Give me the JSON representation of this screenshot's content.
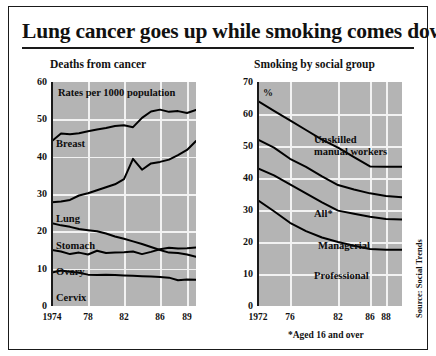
{
  "headline": "Lung cancer goes up while smoking comes down",
  "footnote": "*Aged 16 and over",
  "source": "Source: Social Trends",
  "colors": {
    "plot_background": "#b4b4b4",
    "gridline": "#f2f2f2",
    "line": "#000000",
    "text": "#111111",
    "frame": "#1a1a1a",
    "page_background": "#ffffff"
  },
  "chart_data": [
    {
      "type": "line",
      "title": "Deaths from cancer",
      "annotation": "Rates per 1000 population",
      "xlabel": "",
      "ylabel": "",
      "xlim": [
        1974,
        1990
      ],
      "ylim": [
        0,
        60
      ],
      "grid": true,
      "legend": "inline-labels",
      "x_tick_labels": [
        "1974",
        "78",
        "82",
        "86",
        "89"
      ],
      "x_tick_values": [
        1974,
        1978,
        1982,
        1986,
        1989
      ],
      "y_tick_labels": [
        "0",
        "10",
        "20",
        "30",
        "40",
        "50",
        "60"
      ],
      "y_tick_values": [
        0,
        10,
        20,
        30,
        40,
        50,
        60
      ],
      "x": [
        1974,
        1975,
        1976,
        1977,
        1978,
        1979,
        1980,
        1981,
        1982,
        1983,
        1984,
        1985,
        1986,
        1987,
        1988,
        1989,
        1990
      ],
      "series": [
        {
          "name": "Breast",
          "values": [
            44.2,
            46.2,
            46.0,
            46.3,
            46.8,
            47.3,
            47.7,
            48.2,
            48.4,
            47.9,
            50.4,
            52.1,
            52.6,
            52.0,
            52.2,
            51.7,
            52.5
          ]
        },
        {
          "name": "Lung",
          "values": [
            27.8,
            28.0,
            28.4,
            29.6,
            30.2,
            31.0,
            31.8,
            32.6,
            34.0,
            39.4,
            36.5,
            38.2,
            38.6,
            39.2,
            40.4,
            41.8,
            44.2
          ]
        },
        {
          "name": "Stomach",
          "values": [
            22.2,
            21.6,
            21.2,
            20.6,
            20.3,
            20.0,
            19.4,
            18.6,
            18.0,
            17.3,
            16.6,
            15.8,
            15.0,
            14.3,
            14.2,
            13.8,
            13.2
          ]
        },
        {
          "name": "Ovary",
          "values": [
            15.0,
            14.6,
            13.9,
            14.3,
            13.8,
            14.8,
            14.2,
            14.3,
            14.4,
            14.6,
            13.9,
            14.5,
            15.2,
            15.6,
            15.4,
            15.5,
            15.7
          ]
        },
        {
          "name": "Cervix",
          "values": [
            9.0,
            9.5,
            9.2,
            8.9,
            8.4,
            8.3,
            8.4,
            8.3,
            8.2,
            8.1,
            8.0,
            7.9,
            7.8,
            7.6,
            6.9,
            7.1,
            7.0
          ]
        }
      ]
    },
    {
      "type": "line",
      "title": "Smoking by social group",
      "annotation": "%",
      "xlabel": "",
      "ylabel": "",
      "xlim": [
        1972,
        1990
      ],
      "ylim": [
        0,
        70
      ],
      "grid": true,
      "legend": "inline-labels",
      "x_tick_labels": [
        "1972",
        "76",
        "82",
        "86",
        "88"
      ],
      "x_tick_values": [
        1972,
        1976,
        1982,
        1986,
        1988
      ],
      "y_tick_labels": [
        "0",
        "10",
        "20",
        "30",
        "40",
        "50",
        "60",
        "70"
      ],
      "y_tick_values": [
        0,
        10,
        20,
        30,
        40,
        50,
        60,
        70
      ],
      "x": [
        1972,
        1974,
        1976,
        1978,
        1980,
        1982,
        1984,
        1986,
        1988,
        1990
      ],
      "series": [
        {
          "name": "Unskilled manual workers",
          "values": [
            64.0,
            61.0,
            58.0,
            55.0,
            52.0,
            49.5,
            46.5,
            43.6,
            43.5,
            43.5
          ]
        },
        {
          "name": "All*",
          "values": [
            52.0,
            49.5,
            46.0,
            43.5,
            40.5,
            37.8,
            36.4,
            35.2,
            34.4,
            34.0
          ]
        },
        {
          "name": "Managerial",
          "values": [
            43.0,
            40.8,
            38.0,
            35.2,
            32.4,
            29.8,
            28.8,
            27.9,
            27.2,
            27.0
          ]
        },
        {
          "name": "Professional",
          "values": [
            33.0,
            29.6,
            26.0,
            23.4,
            21.4,
            20.0,
            18.8,
            17.8,
            17.6,
            17.6
          ]
        }
      ]
    }
  ]
}
